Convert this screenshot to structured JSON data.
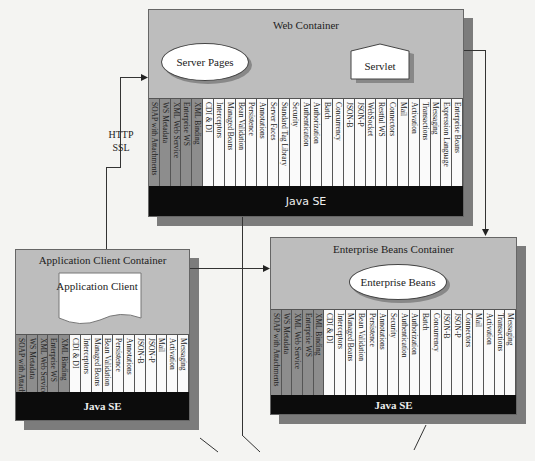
{
  "web_container": {
    "title": "Web Container",
    "components": [
      "Server Pages",
      "Servlet"
    ],
    "dark_columns": [
      "SOAP with Attachments",
      "WS Metadata",
      "XML Web Service",
      "Enterprise WS",
      "XML Binding"
    ],
    "light_columns": [
      "CDI & DI",
      "Interceptors",
      "Managed Beans",
      "Bean Validation",
      "Persistence",
      "Annotations",
      "Server Faces",
      "Standard Tag Library",
      "Security",
      "Authentication",
      "Authorization",
      "Batch",
      "Concurrency",
      "JSON-B",
      "JSON-P",
      "WebSocket",
      "Restful WS",
      "Connectors",
      "Mail",
      "Activation",
      "Transactions",
      "Messaging",
      "Expression Language",
      "Enterprise Beans"
    ],
    "platform": "Java SE"
  },
  "app_client_container": {
    "title": "Application Client Container",
    "component": "Application Client",
    "dark_columns": [
      "SOAP with Attachments",
      "WS Metadata",
      "XML Web Service",
      "Enterprise WS",
      "XML Binding"
    ],
    "light_columns": [
      "CDI & DI",
      "Interceptors",
      "Managed Beans",
      "Bean Validation",
      "Persistence",
      "Annotations",
      "JSON-B",
      "JSON-P",
      "Mail",
      "Activation",
      "Messaging"
    ],
    "platform": "Java SE"
  },
  "ejb_container": {
    "title": "Enterprise Beans Container",
    "component": "Enterprise Beans",
    "dark_columns": [
      "SOAP with Attachments",
      "WS Metadata",
      "XML Web Service",
      "Enterprise WS",
      "XML Binding"
    ],
    "light_columns": [
      "CDI & DI",
      "Interceptors",
      "Managed Beans",
      "Bean Validation",
      "Persistence",
      "Annotations",
      "Security",
      "Authentication",
      "Authorization",
      "Batch",
      "Concurrency",
      "JSON-B",
      "JSON-P",
      "Connectors",
      "Mail",
      "Activation",
      "Transactions",
      "Messaging"
    ],
    "platform": "Java SE"
  },
  "connection_label": {
    "line1": "HTTP",
    "line2": "SSL"
  }
}
